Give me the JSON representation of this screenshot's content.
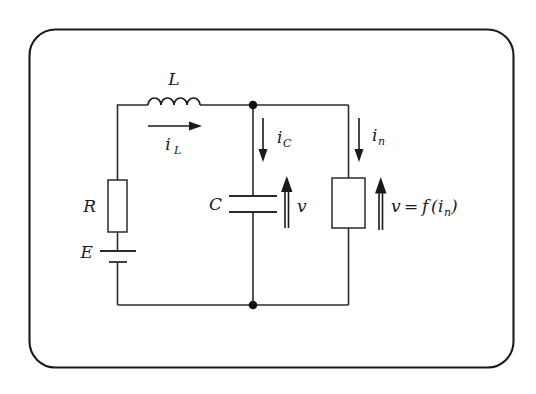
{
  "figure": {
    "type": "circuit-schematic",
    "border_color": "#1a1a1a",
    "wire_color": "#2b2b2b",
    "background": "#ffffff"
  },
  "labels": {
    "inductor": "L",
    "resistor": "R",
    "source": "E",
    "capacitor": "C",
    "current_inductor_base": "i",
    "current_inductor_sub": "L",
    "current_capacitor_base": "i",
    "current_capacitor_sub": "C",
    "current_nonlinear_base": "i",
    "current_nonlinear_sub": "n",
    "voltage_capacitor": "v",
    "voltage_nonlinear_lhs": "v",
    "voltage_nonlinear_eq": "=",
    "voltage_nonlinear_fn": "f",
    "voltage_nonlinear_open": "(",
    "voltage_nonlinear_arg_base": "i",
    "voltage_nonlinear_arg_sub": "n",
    "voltage_nonlinear_close": ")"
  },
  "components": [
    {
      "name": "inductor-L",
      "symbol": "coil",
      "label": "L"
    },
    {
      "name": "resistor-R",
      "symbol": "rectangle",
      "label": "R"
    },
    {
      "name": "voltage-source-E",
      "symbol": "battery",
      "label": "E"
    },
    {
      "name": "capacitor-C",
      "symbol": "plates",
      "label": "C"
    },
    {
      "name": "nonlinear-element",
      "symbol": "rectangle",
      "label": "v = f(i_n)"
    }
  ],
  "currents": [
    {
      "name": "i-L",
      "direction": "right",
      "branch": "inductor"
    },
    {
      "name": "i-C",
      "direction": "down",
      "branch": "capacitor"
    },
    {
      "name": "i-n",
      "direction": "down",
      "branch": "nonlinear"
    }
  ],
  "voltages": [
    {
      "name": "v",
      "direction": "up",
      "across": "capacitor"
    },
    {
      "name": "v = f(in)",
      "direction": "up",
      "across": "nonlinear-element"
    }
  ],
  "nodes": [
    {
      "name": "top-junction",
      "x": 253,
      "y": 105
    },
    {
      "name": "bottom-junction",
      "x": 253,
      "y": 305
    }
  ]
}
